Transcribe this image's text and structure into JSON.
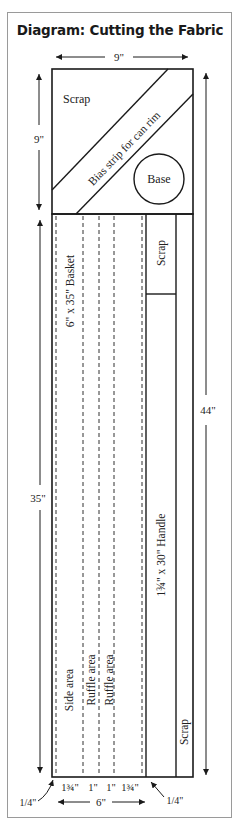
{
  "title": "Diagram: Cutting the Fabric",
  "dimensions": {
    "top_width": "9\"",
    "top_height": "9\"",
    "lower_height": "35\"",
    "total_height": "44\"",
    "bottom_width": "6\"",
    "seam_left": "1/4\"",
    "seam_right": "1/4\""
  },
  "regions": {
    "scrap_top": "Scrap",
    "bias_strip": "Bias strip for can rim",
    "base": "Base",
    "basket": "6\" x 35\" Basket",
    "scrap_small": "Scrap",
    "handle": "1¾\" x 30\" Handle",
    "scrap_long": "Scrap",
    "side_area": "Side area",
    "ruffle_area_1": "Ruffle area",
    "ruffle_area_2": "Ruffle area"
  },
  "bottom_measurements": [
    "1¾\"",
    "1\"",
    "1\"",
    "1¾\""
  ],
  "colors": {
    "line": "#1a1a1a",
    "frame": "#9a9a9a",
    "text": "#222222"
  }
}
